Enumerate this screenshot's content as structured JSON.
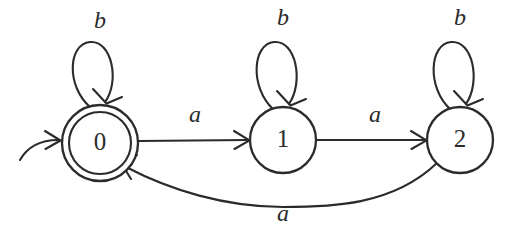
{
  "diagram": {
    "kind": "finite-automaton",
    "background_color": "#ffffff",
    "ink_color": "#2b2b2b",
    "width": 528,
    "height": 233,
    "states": [
      {
        "id": "0",
        "label": "0",
        "cx": 100,
        "cy": 143,
        "r": 38,
        "inner_r": 31,
        "accepting": true,
        "start": true
      },
      {
        "id": "1",
        "label": "1",
        "cx": 283,
        "cy": 140,
        "r": 33,
        "inner_r": 0,
        "accepting": false,
        "start": false
      },
      {
        "id": "2",
        "label": "2",
        "cx": 460,
        "cy": 140,
        "r": 33,
        "inner_r": 0,
        "accepting": false,
        "start": false
      }
    ],
    "transitions": [
      {
        "from": "0",
        "to": "0",
        "label": "b",
        "shape": "self-loop",
        "label_x": 100,
        "label_y": 22
      },
      {
        "from": "1",
        "to": "1",
        "label": "b",
        "shape": "self-loop",
        "label_x": 283,
        "label_y": 19
      },
      {
        "from": "2",
        "to": "2",
        "label": "b",
        "shape": "self-loop",
        "label_x": 460,
        "label_y": 19
      },
      {
        "from": "0",
        "to": "1",
        "label": "a",
        "shape": "straight",
        "label_x": 195,
        "label_y": 116
      },
      {
        "from": "1",
        "to": "2",
        "label": "a",
        "shape": "straight",
        "label_x": 375,
        "label_y": 116
      },
      {
        "from": "2",
        "to": "0",
        "label": "a",
        "shape": "arc-below",
        "label_x": 283,
        "label_y": 215
      }
    ],
    "start_marker": {
      "name": "start-arrow",
      "target_state": "0"
    }
  }
}
